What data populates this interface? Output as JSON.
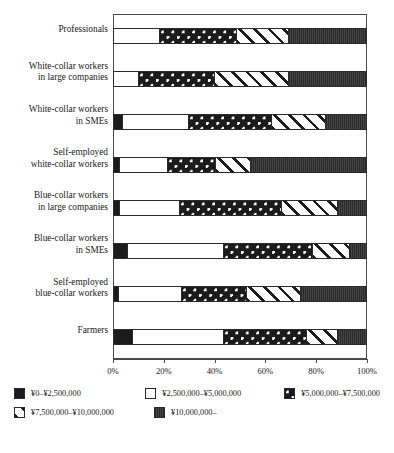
{
  "chart_data": {
    "type": "bar",
    "subtype": "stacked-horizontal-100pct",
    "title": "",
    "xlabel": "",
    "ylabel": "",
    "xlim": [
      0,
      100
    ],
    "grid": false,
    "legend_position": "bottom",
    "xtick_labels": [
      "0%",
      "20%",
      "40%",
      "60%",
      "80%",
      "100%"
    ],
    "xticks": [
      0,
      20,
      40,
      60,
      80,
      100
    ],
    "categories": [
      "Professionals",
      "White-collar workers in large companies",
      "White-collar workers in SMEs",
      "Self-employed white-collar workers",
      "Blue-collar workers in large companies",
      "Blue-collar workers in SMEs",
      "Self-employed blue-collar workers",
      "Farmers"
    ],
    "series": [
      {
        "name": "¥0–¥2,500,000",
        "fill": "black",
        "values": [
          0.0,
          0.0,
          3.1,
          2.0,
          2.0,
          5.1,
          1.6,
          7.1
        ]
      },
      {
        "name": "¥2,500,000–¥5,000,000",
        "fill": "white",
        "values": [
          17.7,
          9.4,
          26.4,
          18.9,
          23.6,
          38.2,
          24.8,
          36.2
        ]
      },
      {
        "name": "¥5,000,000–¥7,500,000",
        "fill": "dots",
        "values": [
          30.7,
          30.4,
          32.7,
          19.3,
          40.5,
          35.4,
          26.0,
          32.7
        ]
      },
      {
        "name": "¥7,500,000–¥10,000,000",
        "fill": "hatch",
        "values": [
          20.5,
          29.1,
          21.7,
          13.7,
          22.5,
          14.6,
          21.6,
          12.6
        ]
      },
      {
        "name": "¥10,000,000–",
        "fill": "dark",
        "values": [
          31.1,
          31.1,
          16.1,
          46.1,
          11.4,
          6.7,
          26.0,
          11.4
        ]
      }
    ]
  },
  "categories_display": [
    {
      "lines": [
        "Professionals"
      ]
    },
    {
      "lines": [
        "White-collar workers",
        "in large companies"
      ]
    },
    {
      "lines": [
        "White-collar workers",
        "in SMEs"
      ]
    },
    {
      "lines": [
        "Self-employed",
        "white-collar workers"
      ]
    },
    {
      "lines": [
        "Blue-collar workers",
        "in large companies"
      ]
    },
    {
      "lines": [
        "Blue-collar workers",
        "in SMEs"
      ]
    },
    {
      "lines": [
        "Self-employed",
        "blue-collar workers"
      ]
    },
    {
      "lines": [
        "Farmers"
      ]
    }
  ],
  "legend": {
    "items": [
      {
        "label": "¥0–¥2,500,000",
        "fill": "black"
      },
      {
        "label": "¥2,500,000–¥5,000,000",
        "fill": "white"
      },
      {
        "label": "¥5,000,000–¥7,500,000",
        "fill": "dots"
      },
      {
        "label": "¥7,500,000–¥10,000,000",
        "fill": "hatch"
      },
      {
        "label": "¥10,000,000–",
        "fill": "dark"
      }
    ]
  },
  "colors": {
    "black": "#1b1b1b",
    "white": "#ffffff",
    "dots_bg": "#1b1b1b",
    "dots_fg": "#ffffff",
    "hatch_bg": "#ffffff",
    "hatch_fg": "#1b1b1b",
    "dark": "#3a3a3a",
    "axis": "#4a4a4a",
    "text": "#1a1a1a"
  }
}
